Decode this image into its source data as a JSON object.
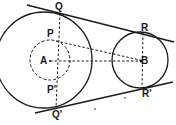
{
  "diagram": {
    "type": "geometry",
    "colors": {
      "stroke": "#1a1a1a",
      "background": "#ffffff"
    },
    "labels": {
      "Q": "Q",
      "Q_prime": "Q'",
      "R": "R",
      "R_prime": "R'",
      "P": "P",
      "P_prime": "P'",
      "A": "A",
      "B": "B"
    },
    "elements": {
      "circle_A": {
        "cx": 44,
        "cy": 60,
        "r": 48,
        "style": "solid"
      },
      "circle_A_inner": {
        "cx": 50,
        "cy": 60,
        "r": 20,
        "style": "dashed"
      },
      "circle_B": {
        "cx": 140,
        "cy": 60,
        "r": 28,
        "style": "solid"
      },
      "tangent_top": {
        "from": "Q",
        "to": "R",
        "style": "solid"
      },
      "tangent_bottom": {
        "from": "Q'",
        "to": "R'",
        "style": "solid"
      },
      "segments_dashed": [
        "QQ'",
        "RR'",
        "AB",
        "PB",
        "P'B"
      ]
    }
  }
}
